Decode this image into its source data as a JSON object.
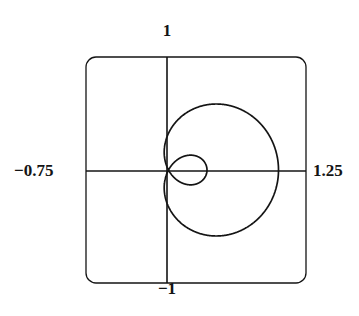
{
  "figure": {
    "kind": "polar-curve-plot",
    "background_color": "#ffffff",
    "stroke_color": "#141414",
    "frame": {
      "x_min_px": 86,
      "y_min_px": 57,
      "width_px": 220,
      "height_px": 226,
      "corner_radius_px": 10,
      "line_width_px": 1.3
    },
    "axes": {
      "origin_x_px": 167,
      "origin_y_px": 171,
      "line_width_px": 1.5
    },
    "labels": {
      "top": "1",
      "bottom": "−1",
      "left": "−0.75",
      "right": "1.25"
    }
  },
  "chart_data": {
    "type": "line",
    "title": "",
    "xlabel": "",
    "ylabel": "",
    "coordinate_system": "cartesian-from-polar",
    "curve_name": "limacon-with-inner-loop",
    "polar_equation": "r = 0.325 + 0.675*cos(theta)",
    "theta_range_rad": [
      0,
      6.283185307179586
    ],
    "xlim": [
      -0.75,
      1.25
    ],
    "ylim": [
      -1,
      1
    ],
    "grid": false,
    "legend": null,
    "axis_tick_labels": {
      "x_left": "-0.75",
      "x_right": "1.25",
      "y_top": "1",
      "y_bottom": "-1"
    },
    "key_points": {
      "right_x_intercept": [
        1.0,
        0.0
      ],
      "left_outer_x_intercept": [
        -0.35,
        0.0
      ],
      "inner_loop_left_x": [
        -0.26,
        0.0
      ],
      "max_y": 0.76,
      "min_y": -0.76
    },
    "x": [
      1.0,
      0.997,
      0.988,
      0.973,
      0.952,
      0.926,
      0.894,
      0.857,
      0.815,
      0.769,
      0.719,
      0.665,
      0.608,
      0.548,
      0.486,
      0.422,
      0.357,
      0.292,
      0.226,
      0.161,
      0.097,
      0.035,
      -0.025,
      -0.081,
      -0.134,
      -0.182,
      -0.226,
      -0.264,
      -0.296,
      -0.322,
      -0.341,
      -0.352,
      -0.356,
      -0.352,
      -0.341,
      -0.322,
      -0.296,
      -0.264,
      -0.226,
      -0.182,
      -0.134,
      -0.081,
      -0.025,
      0.035,
      0.097,
      0.161,
      0.226,
      0.292,
      0.357,
      0.422,
      0.486,
      0.548,
      0.608,
      0.665,
      0.719,
      0.769,
      0.815,
      0.857,
      0.894,
      0.926,
      0.952,
      0.973,
      0.988,
      0.997,
      1.0
    ],
    "y": [
      0.0,
      0.097,
      0.192,
      0.284,
      0.371,
      0.452,
      0.526,
      0.592,
      0.649,
      0.697,
      0.734,
      0.761,
      0.776,
      0.781,
      0.775,
      0.759,
      0.733,
      0.698,
      0.655,
      0.604,
      0.547,
      0.485,
      0.419,
      0.351,
      0.282,
      0.213,
      0.147,
      0.084,
      0.026,
      -0.026,
      -0.07,
      -0.105,
      -0.129,
      -0.142,
      -0.143,
      -0.132,
      -0.11,
      -0.076,
      -0.032,
      0.021,
      0.081,
      0.147,
      0.216,
      0.287,
      0.357,
      0.423,
      0.483,
      0.535,
      0.576,
      0.605,
      0.62,
      0.619,
      0.602,
      0.569,
      0.52,
      0.457,
      0.382,
      0.296,
      0.203,
      0.105,
      0.005,
      -0.095,
      -0.192,
      -0.285,
      -0.371
    ]
  }
}
